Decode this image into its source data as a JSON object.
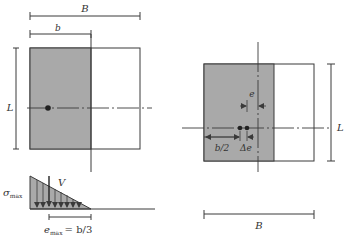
{
  "colors": {
    "stroke": "#3a3a3a",
    "shaded": "#a9a9a9",
    "background": "#ffffff"
  },
  "left_figure": {
    "dim_B_label": "B",
    "dim_b_label": "b",
    "dim_L_label": "L",
    "force_label": "V",
    "stress_label": "σ",
    "stress_sub": "max",
    "ecc_label": "e",
    "ecc_sub": "max",
    "ecc_value": "= b/3"
  },
  "right_figure": {
    "dim_e_label": "e",
    "dim_b2_label": "b/2",
    "dim_delta_e_label": "Δe",
    "dim_L_label": "L",
    "dim_B_label": "B"
  }
}
